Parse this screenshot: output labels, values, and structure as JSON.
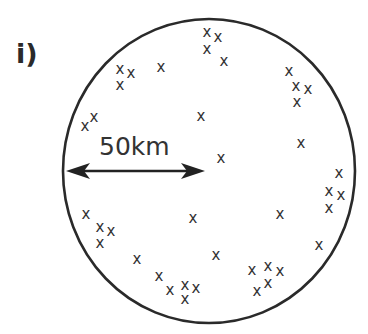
{
  "figure": {
    "label": "i)",
    "scale": {
      "text": "50km",
      "meaning": "radius of circular region"
    },
    "region": {
      "shape": "circle",
      "cx": 209,
      "cy": 171,
      "rx": 146,
      "ry": 152,
      "stroke": "#2a2a2a"
    },
    "arrow": {
      "x1": 66,
      "x2": 205,
      "y": 171,
      "double_headed": true
    },
    "marker_symbol": "x",
    "marker_color": "#333333",
    "points": [
      [
        120,
        70
      ],
      [
        131,
        74
      ],
      [
        120,
        86
      ],
      [
        161,
        68
      ],
      [
        85,
        127
      ],
      [
        94,
        118
      ],
      [
        207,
        33
      ],
      [
        218,
        38
      ],
      [
        207,
        50
      ],
      [
        224,
        62
      ],
      [
        201,
        117
      ],
      [
        221,
        159
      ],
      [
        289,
        72
      ],
      [
        296,
        87
      ],
      [
        308,
        90
      ],
      [
        297,
        103
      ],
      [
        301,
        144
      ],
      [
        339,
        174
      ],
      [
        329,
        192
      ],
      [
        341,
        196
      ],
      [
        329,
        209
      ],
      [
        280,
        215
      ],
      [
        319,
        246
      ],
      [
        86,
        215
      ],
      [
        100,
        228
      ],
      [
        111,
        232
      ],
      [
        100,
        244
      ],
      [
        193,
        219
      ],
      [
        137,
        260
      ],
      [
        159,
        277
      ],
      [
        170,
        291
      ],
      [
        185,
        286
      ],
      [
        196,
        289
      ],
      [
        185,
        300
      ],
      [
        216,
        256
      ],
      [
        252,
        271
      ],
      [
        268,
        267
      ],
      [
        280,
        272
      ],
      [
        268,
        284
      ],
      [
        257,
        292
      ]
    ]
  }
}
